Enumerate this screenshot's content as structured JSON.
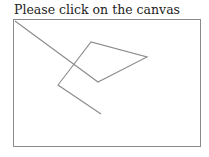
{
  "prompt": {
    "text": "Please click on the canvas"
  },
  "canvas": {
    "border_color": "#8a8a8a",
    "stroke_color": "#8c8c8c",
    "polyline_points": "1,1 84,62 133,37 77,22 44,65 87,94"
  }
}
